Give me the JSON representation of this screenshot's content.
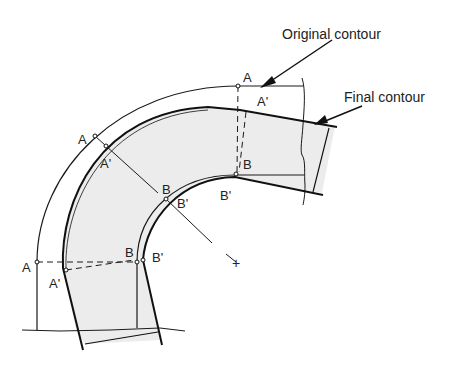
{
  "figure": {
    "type": "bend-cross-section",
    "colors": {
      "stroke": "#1a1a1a",
      "fill": "#ececec",
      "background": "#ffffff"
    },
    "callouts": {
      "original": "Original contour",
      "final": "Final contour"
    },
    "labels": {
      "a_top": "A",
      "a_prime_top": "A'",
      "b_top": "B",
      "b_prime_top": "B'",
      "a_mid": "A",
      "a_prime_mid": "A'",
      "b_mid": "B",
      "b_prime_mid": "B'",
      "a_left": "A",
      "a_prime_left": "A'",
      "b_left": "B",
      "b_prime_left": "B'"
    },
    "center_marker": "+"
  }
}
